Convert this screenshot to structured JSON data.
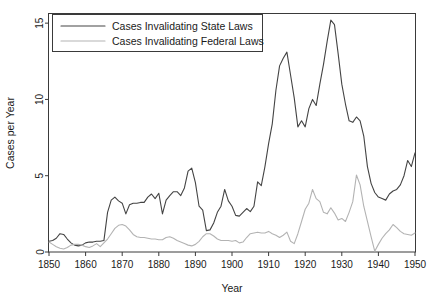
{
  "chart_data": {
    "type": "line",
    "title": "",
    "xlabel": "Year",
    "ylabel": "Cases per Year",
    "xlim": [
      1850,
      1950
    ],
    "ylim": [
      0,
      15.6
    ],
    "grid": false,
    "legend_position": "top-left",
    "xticks": [
      1850,
      1860,
      1870,
      1880,
      1890,
      1900,
      1910,
      1920,
      1930,
      1940,
      1950
    ],
    "yticks": [
      0,
      5,
      10,
      15
    ],
    "xtick_labels": [
      "1850",
      "1860",
      "1870",
      "1880",
      "1890",
      "1900",
      "1910",
      "1920",
      "1930",
      "1940",
      "1950"
    ],
    "ytick_labels": [
      "0",
      "5",
      "10",
      "15"
    ],
    "x": [
      1850,
      1851,
      1852,
      1853,
      1854,
      1855,
      1856,
      1857,
      1858,
      1859,
      1860,
      1861,
      1862,
      1863,
      1864,
      1865,
      1866,
      1867,
      1868,
      1869,
      1870,
      1871,
      1872,
      1873,
      1874,
      1875,
      1876,
      1877,
      1878,
      1879,
      1880,
      1881,
      1882,
      1883,
      1884,
      1885,
      1886,
      1887,
      1888,
      1889,
      1890,
      1891,
      1892,
      1893,
      1894,
      1895,
      1896,
      1897,
      1898,
      1899,
      1900,
      1901,
      1902,
      1903,
      1904,
      1905,
      1906,
      1907,
      1908,
      1909,
      1910,
      1911,
      1912,
      1913,
      1914,
      1915,
      1916,
      1917,
      1918,
      1919,
      1920,
      1921,
      1922,
      1923,
      1924,
      1925,
      1926,
      1927,
      1928,
      1929,
      1930,
      1931,
      1932,
      1933,
      1934,
      1935,
      1936,
      1937,
      1938,
      1939,
      1940,
      1941,
      1942,
      1943,
      1944,
      1945,
      1946,
      1947,
      1948,
      1949,
      1950
    ],
    "series": [
      {
        "name": "Cases Invalidating State Laws",
        "color": "#444444",
        "values": [
          0.7,
          0.75,
          0.9,
          1.2,
          1.15,
          0.85,
          0.6,
          0.45,
          0.4,
          0.45,
          0.6,
          0.65,
          0.65,
          0.7,
          0.7,
          0.75,
          2.6,
          3.4,
          3.6,
          3.35,
          3.2,
          2.5,
          3.1,
          3.2,
          3.2,
          3.25,
          3.25,
          3.6,
          3.8,
          3.5,
          3.85,
          2.5,
          3.4,
          3.7,
          3.95,
          3.95,
          3.7,
          4.2,
          5.3,
          5.5,
          4.55,
          3.0,
          2.75,
          1.4,
          1.45,
          1.9,
          2.6,
          3.0,
          4.1,
          3.35,
          3.0,
          2.4,
          2.35,
          2.6,
          2.85,
          2.65,
          3.0,
          4.6,
          4.35,
          5.6,
          7.1,
          8.4,
          10.6,
          12.2,
          12.7,
          13.1,
          11.6,
          10.1,
          8.2,
          8.6,
          8.2,
          9.4,
          10.0,
          9.6,
          11.0,
          12.3,
          13.8,
          15.2,
          14.9,
          13.0,
          11.0,
          9.7,
          8.6,
          8.5,
          8.85,
          8.6,
          7.6,
          5.6,
          4.5,
          3.9,
          3.6,
          3.5,
          3.4,
          3.8,
          4.0,
          4.1,
          4.4,
          5.0,
          6.0,
          5.6,
          6.5
        ]
      },
      {
        "name": "Cases Invalidating Federal Laws",
        "color": "#b3b3b3",
        "values": [
          0.65,
          0.5,
          0.35,
          0.25,
          0.2,
          0.3,
          0.45,
          0.5,
          0.5,
          0.45,
          0.35,
          0.3,
          0.4,
          0.55,
          0.35,
          0.6,
          0.85,
          1.2,
          1.55,
          1.75,
          1.8,
          1.7,
          1.45,
          1.15,
          1.0,
          0.95,
          0.95,
          0.9,
          0.85,
          0.85,
          0.8,
          0.8,
          0.95,
          1.0,
          0.9,
          0.75,
          0.65,
          0.55,
          0.45,
          0.4,
          0.5,
          0.7,
          1.0,
          1.2,
          1.2,
          1.05,
          0.85,
          0.75,
          0.75,
          0.75,
          0.7,
          0.75,
          0.6,
          0.65,
          0.95,
          1.2,
          1.25,
          1.3,
          1.25,
          1.25,
          1.35,
          1.2,
          1.1,
          0.95,
          1.1,
          1.3,
          0.7,
          0.55,
          1.2,
          2.0,
          2.8,
          3.2,
          4.1,
          3.5,
          3.3,
          2.6,
          2.5,
          2.9,
          2.55,
          2.1,
          2.2,
          2.0,
          2.6,
          3.3,
          5.05,
          4.4,
          3.0,
          2.0,
          1.0,
          0.05,
          0.5,
          0.9,
          1.2,
          1.45,
          1.8,
          1.6,
          1.35,
          1.2,
          1.15,
          1.1,
          1.25
        ]
      }
    ]
  }
}
